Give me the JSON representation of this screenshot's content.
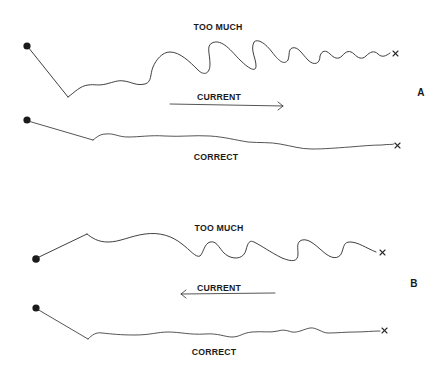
{
  "diagram": {
    "panels": [
      {
        "id": "A",
        "letter": "A",
        "too_much_label": "TOO MUCH",
        "current_label": "CURRENT",
        "current_direction": "right",
        "correct_label": "CORRECT"
      },
      {
        "id": "B",
        "letter": "B",
        "too_much_label": "TOO MUCH",
        "current_label": "CURRENT",
        "current_direction": "left",
        "correct_label": "CORRECT"
      }
    ],
    "colors": {
      "background": "#ffffff",
      "ink": "#2a2a2a"
    },
    "icons": {
      "line_start": "filled-dot",
      "line_end": "x-mark",
      "current": "arrow"
    }
  }
}
